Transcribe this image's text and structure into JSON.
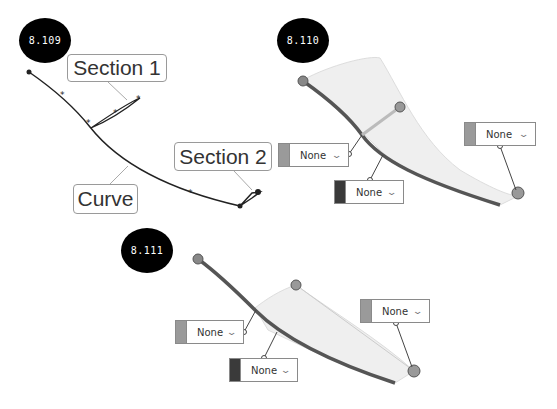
{
  "figures": [
    {
      "id": "8.109",
      "labels": {
        "section1": "Section 1",
        "section2": "Section 2",
        "curve": "Curve"
      }
    },
    {
      "id": "8.110",
      "dropdowns": [
        {
          "value": "None",
          "swatch": "#9a9a9a"
        },
        {
          "value": "None",
          "swatch": "#3a3a3a"
        },
        {
          "value": "None",
          "swatch": "#9a9a9a"
        }
      ]
    },
    {
      "id": "8.111",
      "dropdowns": [
        {
          "value": "None",
          "swatch": "#9a9a9a"
        },
        {
          "value": "None",
          "swatch": "#3a3a3a"
        },
        {
          "value": "None",
          "swatch": "#9a9a9a"
        }
      ]
    }
  ],
  "icons": {
    "dropdown": "chevron-down-icon"
  },
  "colors": {
    "curve": "#333333",
    "thick_curve": "#555555",
    "surface": "#efefef",
    "badge": "#000000"
  }
}
